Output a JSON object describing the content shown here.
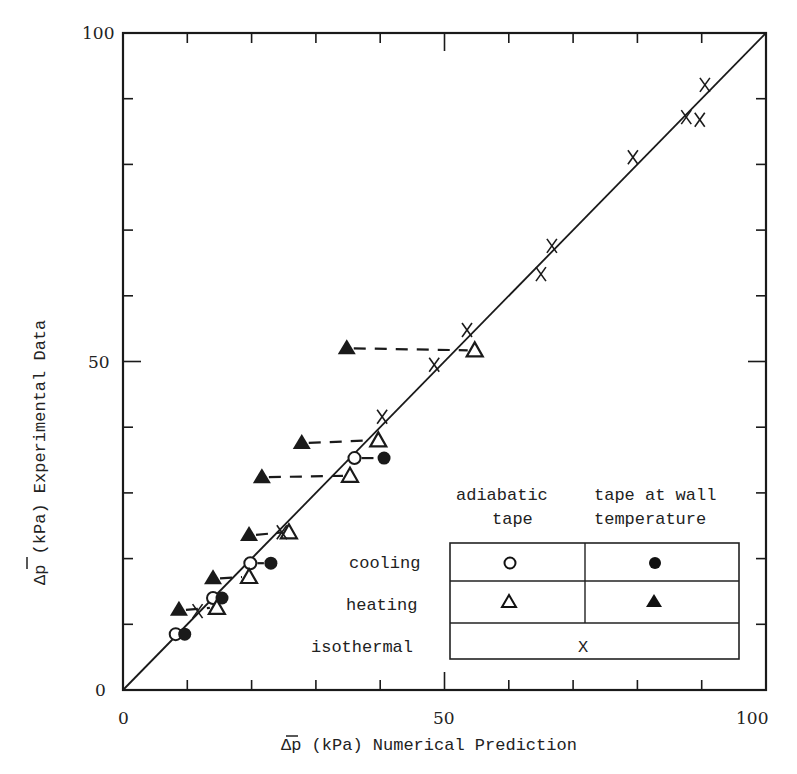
{
  "chart_data": {
    "type": "scatter",
    "title": "",
    "xlabel": "Δp̄ (kPa)  Numerical Prediction",
    "ylabel": "Δp̄ (kPa)  Experimental Data",
    "xlim": [
      0,
      100
    ],
    "ylim": [
      0,
      100
    ],
    "x_ticks": [
      0,
      50,
      100
    ],
    "y_ticks": [
      0,
      50,
      100
    ],
    "minor_tick_step": 10,
    "grid": false,
    "reference_line": {
      "type": "y=x",
      "from": [
        0,
        0
      ],
      "to": [
        100,
        100
      ]
    },
    "legend": {
      "position": "lower-right",
      "column_headers": [
        "adiabatic tape",
        "tape at wall temperature"
      ],
      "rows": [
        {
          "label": "cooling",
          "adiabatic": "open-circle",
          "wall": "filled-circle"
        },
        {
          "label": "heating",
          "adiabatic": "open-triangle",
          "wall": "filled-triangle"
        },
        {
          "label": "isothermal",
          "symbol": "x"
        }
      ]
    },
    "series": [
      {
        "name": "cooling, adiabatic tape",
        "marker": "open-circle",
        "points": [
          [
            8.2,
            8.5
          ],
          [
            14.0,
            14.0
          ],
          [
            19.8,
            19.3
          ],
          [
            36.0,
            35.3
          ]
        ]
      },
      {
        "name": "cooling, tape at wall temperature",
        "marker": "filled-circle",
        "points": [
          [
            9.6,
            8.5
          ],
          [
            15.4,
            14.0
          ],
          [
            23.0,
            19.3
          ],
          [
            40.6,
            35.3
          ]
        ]
      },
      {
        "name": "heating, adiabatic tape",
        "marker": "open-triangle",
        "points": [
          [
            14.6,
            12.5
          ],
          [
            19.6,
            17.2
          ],
          [
            25.8,
            24.0
          ],
          [
            35.3,
            32.6
          ],
          [
            39.7,
            38.0
          ],
          [
            54.7,
            51.7
          ]
        ]
      },
      {
        "name": "heating, tape at wall temperature",
        "marker": "filled-triangle",
        "points": [
          [
            8.7,
            12.2
          ],
          [
            14.0,
            17.0
          ],
          [
            19.6,
            23.6
          ],
          [
            21.6,
            32.4
          ],
          [
            27.8,
            37.6
          ],
          [
            34.8,
            52.0
          ]
        ]
      },
      {
        "name": "isothermal",
        "marker": "x",
        "points": [
          [
            11.6,
            12.0
          ],
          [
            24.7,
            24.0
          ],
          [
            40.3,
            41.6
          ],
          [
            48.4,
            49.5
          ],
          [
            53.5,
            54.8
          ],
          [
            65.0,
            63.3
          ],
          [
            66.7,
            67.6
          ],
          [
            79.3,
            81.1
          ],
          [
            87.6,
            87.2
          ],
          [
            89.7,
            86.8
          ],
          [
            90.5,
            92.1
          ]
        ]
      }
    ],
    "dashed_connectors": [
      [
        [
          8.7,
          12.2
        ],
        [
          14.6,
          12.5
        ]
      ],
      [
        [
          14.0,
          17.0
        ],
        [
          19.6,
          17.2
        ]
      ],
      [
        [
          19.6,
          23.6
        ],
        [
          25.8,
          24.0
        ]
      ],
      [
        [
          21.6,
          32.4
        ],
        [
          35.3,
          32.6
        ]
      ],
      [
        [
          27.8,
          37.6
        ],
        [
          39.7,
          38.0
        ]
      ],
      [
        [
          34.8,
          52.0
        ],
        [
          54.7,
          51.7
        ]
      ],
      [
        [
          8.2,
          8.5
        ],
        [
          9.6,
          8.5
        ]
      ],
      [
        [
          14.0,
          14.0
        ],
        [
          15.4,
          14.0
        ]
      ],
      [
        [
          19.8,
          19.3
        ],
        [
          23.0,
          19.3
        ]
      ],
      [
        [
          36.0,
          35.3
        ],
        [
          40.6,
          35.3
        ]
      ]
    ]
  },
  "axes": {
    "x_tick_labels": [
      "0",
      "50",
      "100"
    ],
    "y_tick_labels": [
      "0",
      "50",
      "100"
    ],
    "x_title": "Δp (kPa)  Numerical Prediction",
    "y_title": "Δp (kPa)  Experimental Data"
  },
  "legend": {
    "header_col1_line1": "adiabatic",
    "header_col1_line2": "tape",
    "header_col2_line1": "tape at wall",
    "header_col2_line2": "temperature",
    "row_cooling": "cooling",
    "row_heating": "heating",
    "row_isothermal": "isothermal",
    "isothermal_symbol": "X"
  },
  "colors": {
    "ink": "#1a1a1a",
    "background": "#ffffff"
  }
}
